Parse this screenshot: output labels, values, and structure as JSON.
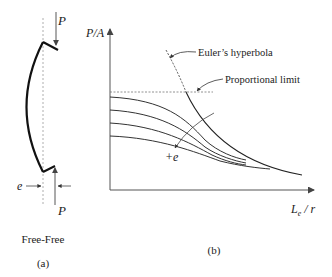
{
  "panel_a": {
    "load_top_label": "P",
    "load_bottom_label": "P",
    "eccentricity_label": "e",
    "end_condition": "Free-Free",
    "caption": "(a)"
  },
  "panel_b": {
    "y_axis_label": "P/A",
    "x_axis_label_main": "L",
    "x_axis_label_sub": "e",
    "x_axis_label_tail": " / r",
    "euler_label": "Euler’s hyperbola",
    "proportional_label": "Proportional limit",
    "increasing_e_label": "+e",
    "caption": "(b)",
    "curve_count": 4
  },
  "colors": {
    "ink": "#222222",
    "axis": "#555555",
    "guide": "#888888"
  }
}
